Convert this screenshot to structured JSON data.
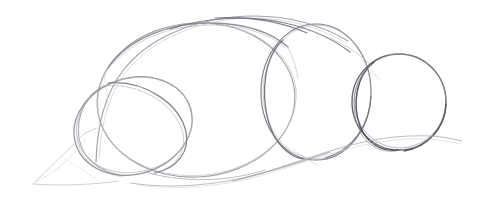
{
  "document": {
    "type": "pencil-sketch",
    "medium": "graphite pencil on white paper",
    "subject": "animal construction sketch - overlapping circles and ellipses",
    "width": 497,
    "height": 203,
    "background_color": "#ffffff"
  },
  "palette": {
    "paper": "#ffffff",
    "stroke_faint": "#c8c8cc",
    "stroke_light": "#b0b0b6",
    "stroke_medium": "#8d8d95",
    "stroke_dark": "#6a6a72",
    "stroke_darkest": "#4a4a52"
  },
  "shapes": [
    {
      "id": "body-ellipse",
      "name": "large-body-ellipse",
      "role": "main torso construction ellipse",
      "cx": 196,
      "cy": 100,
      "rx": 99,
      "ry": 77,
      "rotation": -4,
      "stroke": "#9b9ba2",
      "stroke_width": 1.1
    },
    {
      "id": "haunch-ellipse",
      "name": "haunch-ellipse",
      "role": "tilted rear haunch ellipse overlapping body at left",
      "cx": 133,
      "cy": 126,
      "rx": 60,
      "ry": 48,
      "rotation": -18,
      "stroke": "#8d8d95",
      "stroke_width": 1.2
    },
    {
      "id": "chest-circle",
      "name": "chest-circle",
      "role": "middle circle - chest mass",
      "cx": 316,
      "cy": 92,
      "rx": 55,
      "ry": 68,
      "rotation": 0,
      "stroke": "#7d7d86",
      "stroke_width": 1.2
    },
    {
      "id": "head-circle",
      "name": "head-circle",
      "role": "rightmost circle - head mass, darkest line",
      "cx": 399,
      "cy": 102,
      "rx": 47,
      "ry": 48,
      "rotation": 0,
      "stroke": "#63636c",
      "stroke_width": 1.4
    }
  ],
  "lines": [
    {
      "id": "back-sweep",
      "name": "back-contour-line",
      "role": "long sweeping back / spine guideline from lower-left up over the top to the right",
      "stroke": "#8d8d95",
      "stroke_width": 1.2
    },
    {
      "id": "belly-sweep",
      "name": "belly-contour-line",
      "role": "lower sweeping belly guideline running to the right edge",
      "stroke": "#b0b0b6",
      "stroke_width": 1.0
    },
    {
      "id": "wedge-upper",
      "name": "wedge-upper-edge",
      "role": "faint triangular wedge upper edge at lower left (tail/leg block-in)",
      "stroke": "#c8c8cc",
      "stroke_width": 1.0
    },
    {
      "id": "wedge-lower",
      "name": "wedge-lower-edge",
      "role": "faint triangular wedge lower edge at lower left",
      "stroke": "#c8c8cc",
      "stroke_width": 1.0
    }
  ],
  "chart_data": {
    "type": "scatter",
    "title": "",
    "xlabel": "",
    "ylabel": "",
    "xlim": [
      0,
      497
    ],
    "ylim": [
      0,
      203
    ],
    "grid": false,
    "legend": null,
    "note": "Not a data chart - freehand pencil construction sketch of overlapping circular masses."
  }
}
